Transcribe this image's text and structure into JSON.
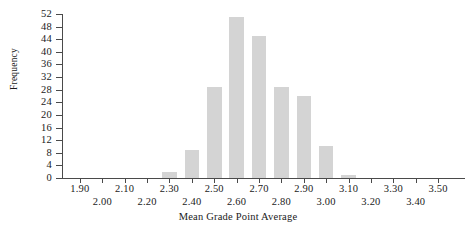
{
  "chart_data": {
    "type": "bar",
    "title": "",
    "subtitle": "",
    "xlabel": "Mean Grade Point Average",
    "ylabel": "Frequency",
    "categories": [
      "2.30",
      "2.40",
      "2.50",
      "2.60",
      "2.70",
      "2.80",
      "2.90",
      "3.00",
      "3.10"
    ],
    "values": [
      2,
      9,
      29,
      51,
      45,
      29,
      26,
      10,
      1
    ],
    "x": [
      2.3,
      2.4,
      2.5,
      2.6,
      2.7,
      2.8,
      2.9,
      3.0,
      3.1
    ],
    "bin_width": 0.065,
    "xlim": [
      1.82,
      3.62
    ],
    "ylim": [
      0,
      52
    ],
    "grid": false,
    "legend": null,
    "bar_color": "#d4d4d4",
    "axis_color": "#4a4a4a",
    "y_ticks": [
      0,
      4,
      8,
      12,
      16,
      20,
      24,
      28,
      32,
      36,
      40,
      44,
      48,
      52
    ],
    "y_tick_labels": [
      "0",
      "4",
      "8",
      "12",
      "16",
      "20",
      "24",
      "28",
      "32",
      "36",
      "40",
      "44",
      "48",
      "52"
    ],
    "x_ticks_upper": [
      {
        "value": 1.9,
        "label": "1.90"
      },
      {
        "value": 2.1,
        "label": "2.10"
      },
      {
        "value": 2.3,
        "label": "2.30"
      },
      {
        "value": 2.5,
        "label": "2.50"
      },
      {
        "value": 2.7,
        "label": "2.70"
      },
      {
        "value": 2.9,
        "label": "2.90"
      },
      {
        "value": 3.1,
        "label": "3.10"
      },
      {
        "value": 3.3,
        "label": "3.30"
      },
      {
        "value": 3.5,
        "label": "3.50"
      }
    ],
    "x_ticks_lower": [
      {
        "value": 2.0,
        "label": "2.00"
      },
      {
        "value": 2.2,
        "label": "2.20"
      },
      {
        "value": 2.4,
        "label": "2.40"
      },
      {
        "value": 2.6,
        "label": "2.60"
      },
      {
        "value": 2.8,
        "label": "2.80"
      },
      {
        "value": 3.0,
        "label": "3.00"
      },
      {
        "value": 3.2,
        "label": "3.20"
      },
      {
        "value": 3.4,
        "label": "3.40"
      }
    ]
  }
}
